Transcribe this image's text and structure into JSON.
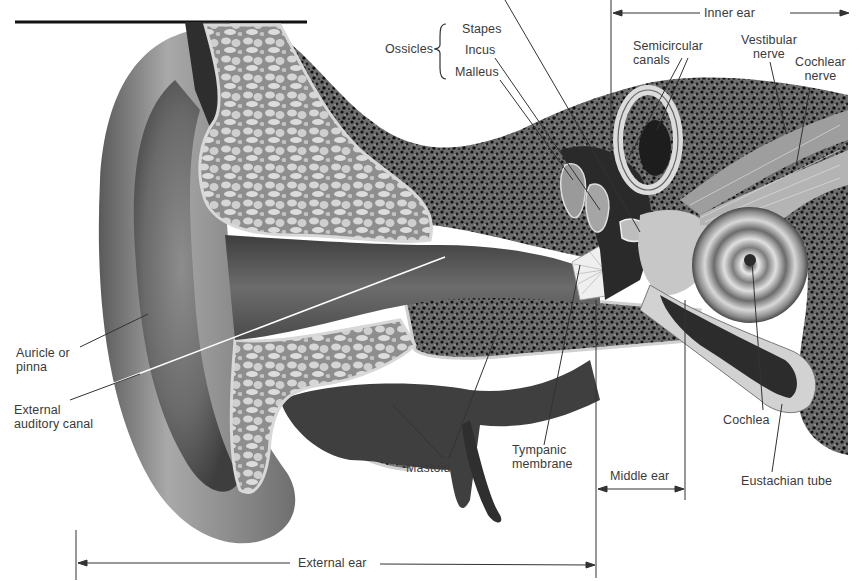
{
  "diagram": {
    "colors": {
      "background": "#ffffff",
      "label_text": "#3a3a3a",
      "skin_dark": "#3c3c3c",
      "skin_mid": "#7a7a7a",
      "skin_light": "#b8b8b8",
      "cartilage_fill": "#c9c9c9",
      "bone_speckle": "#1e1e1e",
      "leader_line": "#333333"
    },
    "labels": {
      "ossicles": "Ossicles",
      "stapes": "Stapes",
      "incus": "Incus",
      "malleus": "Malleus",
      "semicircular_line1": "Semicircular",
      "semicircular_line2": "canals",
      "vestibular_line1": "Vestibular",
      "vestibular_line2": "nerve",
      "cochlear_nerve_line1": "Cochlear",
      "cochlear_nerve_line2": "nerve",
      "auricle_line1": "Auricle or",
      "auricle_line2": "pinna",
      "canal_line1": "External",
      "canal_line2": "auditory canal",
      "mastoid": "Mastoid",
      "tympanic_line1": "Tympanic",
      "tympanic_line2": "membrane",
      "cochlea": "Cochlea",
      "eustachian": "Eustachian tube"
    },
    "regions": {
      "inner_ear": "Inner ear",
      "middle_ear": "Middle ear",
      "external_ear": "External ear"
    }
  }
}
